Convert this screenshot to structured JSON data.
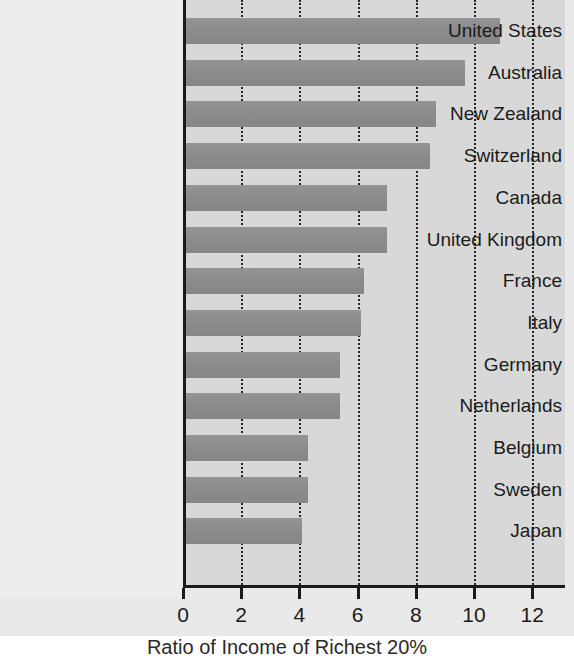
{
  "chart_data": {
    "type": "bar",
    "orientation": "horizontal",
    "title": "",
    "xlabel": "Ratio of Income of Richest 20%",
    "ylabel": "",
    "categories": [
      "United States",
      "Australia",
      "New Zealand",
      "Switzerland",
      "Canada",
      "United Kingdom",
      "France",
      "Italy",
      "Germany",
      "Netherlands",
      "Belgium",
      "Sweden",
      "Japan"
    ],
    "values": [
      10.8,
      9.6,
      8.6,
      8.4,
      6.9,
      6.9,
      6.1,
      6.0,
      5.3,
      5.3,
      4.2,
      4.2,
      4.0
    ],
    "xlim": [
      0,
      13.1
    ],
    "xticks": [
      0,
      2,
      4,
      6,
      8,
      10,
      12
    ],
    "xtick_labels": [
      "0",
      "2",
      "4",
      "6",
      "8",
      "10",
      "12"
    ],
    "grid": true,
    "grid_style": "dotted-vertical",
    "legend": null,
    "bar_color": "#8d8d8d",
    "plot_background": "#d8d8d8",
    "axis_color": "#1a1a1a",
    "page_background": "#e9e9e9"
  }
}
